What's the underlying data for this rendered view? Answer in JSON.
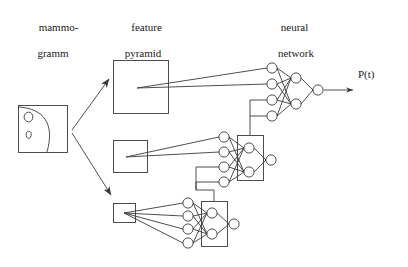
{
  "figure": {
    "background": "#ffffff",
    "stroke": "#3a3a3a",
    "text_color": "#1a1a1a"
  },
  "labels": {
    "mammogram": {
      "line1": "mammo-",
      "line2": "gramm"
    },
    "feature_pyramid": {
      "line1": "feature",
      "line2": "pyramid"
    },
    "neural_network": {
      "line1": "neural",
      "line2": "network"
    },
    "output": "P(t)"
  },
  "diagram_data": {
    "type": "diagram",
    "description": "Mammogram feeds a 3-level feature pyramid; each pyramid level feeds a small neural network, and the networks cascade upward into a final neural network producing P(t).",
    "mammogram_box": {
      "x": 18,
      "y": 105,
      "w": 50,
      "h": 48
    },
    "pyramid_boxes": [
      {
        "name": "level-large",
        "x": 113,
        "y": 60,
        "w": 55,
        "h": 53
      },
      {
        "name": "level-medium",
        "x": 113,
        "y": 140,
        "w": 34,
        "h": 32
      },
      {
        "name": "level-small",
        "x": 113,
        "y": 203,
        "w": 22,
        "h": 19
      }
    ],
    "networks": [
      {
        "name": "network-top",
        "input_nodes": 4,
        "hidden_nodes": 2,
        "output_nodes": 1,
        "input_x": 272,
        "hidden_x": 296,
        "output_x": 318,
        "input_ys": [
          68,
          84,
          100,
          116
        ],
        "hidden_ys": [
          78,
          104
        ],
        "output_y": 90
      },
      {
        "name": "network-middle",
        "input_nodes": 4,
        "hidden_nodes": 2,
        "output_nodes": 1,
        "input_x": 224,
        "hidden_x": 249,
        "output_x": 271,
        "input_ys": [
          137,
          152,
          167,
          182
        ],
        "hidden_ys": [
          148,
          172
        ],
        "output_y": 160,
        "hidden_box": {
          "x": 237,
          "y": 135,
          "w": 26,
          "h": 45
        }
      },
      {
        "name": "network-bottom",
        "input_nodes": 4,
        "hidden_nodes": 2,
        "output_nodes": 1,
        "input_x": 188,
        "hidden_x": 212,
        "output_x": 234,
        "input_ys": [
          203,
          216,
          229,
          243
        ],
        "hidden_ys": [
          213,
          234
        ],
        "output_y": 224,
        "hidden_box": {
          "x": 201,
          "y": 201,
          "w": 26,
          "h": 45
        }
      }
    ],
    "arrows": [
      {
        "name": "mammogram-to-large-pyramid",
        "from": [
          72,
          130
        ],
        "to": [
          110,
          78
        ]
      },
      {
        "name": "mammogram-to-small-pyramid",
        "from": [
          72,
          133
        ],
        "to": [
          112,
          196
        ]
      },
      {
        "name": "network-to-output",
        "from": [
          328,
          90
        ],
        "to": [
          352,
          90
        ]
      }
    ],
    "cascade_links": [
      {
        "name": "middle-net-to-top-net",
        "path": "up from middle hidden box to top network inputs 3 and 4"
      },
      {
        "name": "bottom-net-to-middle-net",
        "path": "up from bottom hidden box to middle network inputs 3 and 4"
      }
    ]
  }
}
